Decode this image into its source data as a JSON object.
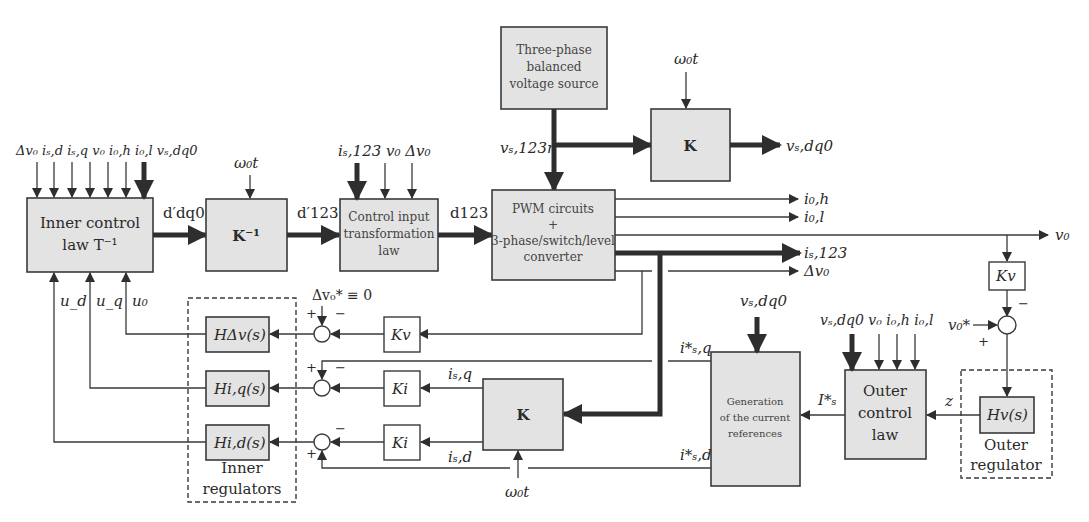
{
  "blocks": {
    "inner_control_line1": "Inner control",
    "inner_control_line2": "law T⁻¹",
    "k_inverse": "K⁻¹",
    "control_input_line1": "Control input",
    "control_input_line2": "transformation",
    "control_input_line3": "law",
    "source_line1": "Three-phase",
    "source_line2": "balanced",
    "source_line3": "voltage source",
    "k_top": "K",
    "pwm_line1": "PWM circuits",
    "pwm_line2": "+",
    "pwm_line3": "3-phase/switch/level",
    "pwm_line4": "converter",
    "k_bottom": "K",
    "gen_line1": "Generation",
    "gen_line2": "of the current",
    "gen_line3": "references",
    "outer_line1": "Outer",
    "outer_line2": "control",
    "outer_line3": "law",
    "h_dv": "HΔv(s)",
    "h_iq": "Hi,q(s)",
    "h_id": "Hi,d(s)",
    "h_v": "Hv(s)",
    "kv_mid": "Kv",
    "ki_q": "Ki",
    "ki_d": "Ki",
    "kv_right": "Kv"
  },
  "groups": {
    "inner_regulators_line1": "Inner",
    "inner_regulators_line2": "regulators",
    "outer_regulator_line1": "Outer",
    "outer_regulator_line2": "regulator"
  },
  "signals": {
    "inner_inputs": "Δv₀ iₛ,d iₛ,q v₀ i₀,h i₀,l vₛ,dq0",
    "d_dq0": "d′dq0",
    "d_123_prime": "d′123",
    "d_123": "d123",
    "omega_t_kinv": "ω₀t",
    "omega_t_ktop": "ω₀t",
    "omega_t_kbottom": "ω₀t",
    "ci_inputs": "iₛ,123 v₀ Δv₀",
    "v_s123n": "vₛ,123n",
    "v_sdq0_out": "vₛ,dq0",
    "i0h": "i₀,h",
    "i0l": "i₀,l",
    "v0": "v₀",
    "is123": "iₛ,123",
    "dv0": "Δv₀",
    "u_d": "u_d",
    "u_q": "u_q",
    "u_0": "u₀",
    "dv0_ref": "Δv₀* ≡ 0",
    "isq": "iₛ,q",
    "isd": "iₛ,d",
    "isq_ref": "i*ₛ,q",
    "isd_ref": "i*ₛ,d",
    "v_sdq0_gen": "vₛ,dq0",
    "outer_inputs": "vₛ,dq0 v₀ i₀,h i₀,l",
    "Is_ref": "I*ₛ",
    "z": "z",
    "v0_ref": "v₀*",
    "plus": "+",
    "minus": "−"
  }
}
